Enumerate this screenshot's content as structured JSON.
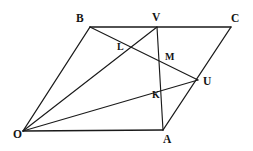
{
  "figure": {
    "canvas": {
      "width": 253,
      "height": 151,
      "background": "#ffffff"
    },
    "stroke_color": "#1a1a1a",
    "label_color": "#141414",
    "vertices": [
      {
        "name": "B",
        "label": "B",
        "x": 90,
        "y": 27,
        "label_x": 76,
        "label_y": 13
      },
      {
        "name": "V",
        "label": "V",
        "x": 157,
        "y": 27,
        "label_x": 152,
        "label_y": 12
      },
      {
        "name": "C",
        "label": "C",
        "x": 231,
        "y": 27,
        "label_x": 231,
        "label_y": 13
      },
      {
        "name": "U",
        "label": "U",
        "x": 198,
        "y": 80,
        "label_x": 203,
        "label_y": 76
      },
      {
        "name": "O",
        "label": "O",
        "x": 23,
        "y": 131,
        "label_x": 13,
        "label_y": 129
      },
      {
        "name": "A",
        "label": "A",
        "x": 163,
        "y": 130,
        "label_x": 163,
        "label_y": 134
      }
    ],
    "intersection_points": [
      {
        "name": "L",
        "label": "L",
        "x": 128,
        "y": 48,
        "label_x": 117,
        "label_y": 42
      },
      {
        "name": "M",
        "label": "M",
        "x": 163,
        "y": 57,
        "label_x": 165,
        "label_y": 52
      },
      {
        "name": "K",
        "label": "K",
        "x": 158,
        "y": 96,
        "label_x": 152,
        "label_y": 90
      }
    ],
    "segments": [
      {
        "name": "side-OB",
        "from": "O",
        "to": "B",
        "x1": 23,
        "y1": 131,
        "x2": 90,
        "y2": 27,
        "weight": "thick"
      },
      {
        "name": "side-BC",
        "from": "B",
        "to": "C",
        "x1": 90,
        "y1": 27,
        "x2": 231,
        "y2": 27,
        "weight": "thick"
      },
      {
        "name": "side-CA",
        "from": "C",
        "to": "A",
        "x1": 231,
        "y1": 27,
        "x2": 163,
        "y2": 130,
        "weight": "thick"
      },
      {
        "name": "side-AO",
        "from": "A",
        "to": "O",
        "x1": 163,
        "y1": 130,
        "x2": 23,
        "y2": 131,
        "weight": "thick"
      },
      {
        "name": "cevian-OV",
        "from": "O",
        "to": "V",
        "x1": 23,
        "y1": 131,
        "x2": 157,
        "y2": 27,
        "weight": "normal"
      },
      {
        "name": "cevian-OU",
        "from": "O",
        "to": "U",
        "x1": 23,
        "y1": 131,
        "x2": 198,
        "y2": 80,
        "weight": "normal"
      },
      {
        "name": "cevian-BU",
        "from": "B",
        "to": "U",
        "x1": 90,
        "y1": 27,
        "x2": 198,
        "y2": 80,
        "weight": "normal"
      },
      {
        "name": "cevian-VA",
        "from": "V",
        "to": "A",
        "x1": 157,
        "y1": 27,
        "x2": 163,
        "y2": 130,
        "weight": "normal"
      }
    ]
  }
}
